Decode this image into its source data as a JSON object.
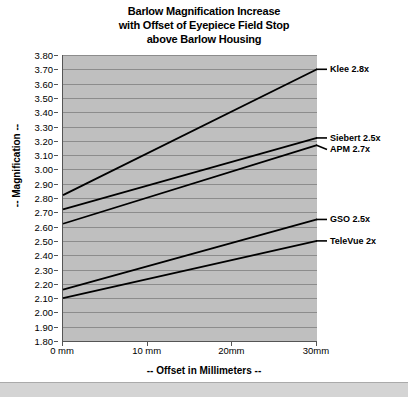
{
  "chart_data": {
    "type": "line",
    "title": "Barlow Magnification Increase with Offset of Eyepiece Field Stop above Barlow Housing",
    "title_lines": [
      "Barlow Magnification Increase",
      "with Offset of Eyepiece Field Stop",
      "above Barlow Housing"
    ],
    "xlabel": "-- Offset in Millimeters --",
    "ylabel": "-- Magnification --",
    "xlim": [
      0,
      30
    ],
    "ylim": [
      1.8,
      3.8
    ],
    "grid": true,
    "legend_position": "right-inline-labels",
    "plot_background": "#bfbfbf",
    "line_color": "#000000",
    "x": [
      0,
      30
    ],
    "x_tick_values": [
      0,
      10,
      20,
      30
    ],
    "x_tick_labels": [
      "0 mm",
      "10 mm",
      "20mm",
      "30mm"
    ],
    "y_tick_values": [
      1.8,
      1.9,
      2.0,
      2.1,
      2.2,
      2.3,
      2.4,
      2.5,
      2.6,
      2.7,
      2.8,
      2.9,
      3.0,
      3.1,
      3.2,
      3.3,
      3.4,
      3.5,
      3.6,
      3.7,
      3.8
    ],
    "y_tick_labels": [
      "1.80",
      "1.90",
      "2.00",
      "2.10",
      "2.20",
      "2.30",
      "2.40",
      "2.50",
      "2.60",
      "2.70",
      "2.80",
      "2.90",
      "3.00",
      "3.10",
      "3.20",
      "3.30",
      "3.40",
      "3.50",
      "3.60",
      "3.70",
      "3.80"
    ],
    "series": [
      {
        "name": "Klee 2.8x",
        "values": [
          2.82,
          3.7
        ],
        "label_y_value": 3.7
      },
      {
        "name": "Siebert 2.5x",
        "values": [
          2.72,
          3.22
        ],
        "label_y_value": 3.22
      },
      {
        "name": "APM 2.7x",
        "values": [
          2.62,
          3.17
        ],
        "label_y_value": 3.14
      },
      {
        "name": "GSO 2.5x",
        "values": [
          2.16,
          2.65
        ],
        "label_y_value": 2.65
      },
      {
        "name": "TeleVue 2x",
        "values": [
          2.1,
          2.5
        ],
        "label_y_value": 2.5
      }
    ]
  }
}
